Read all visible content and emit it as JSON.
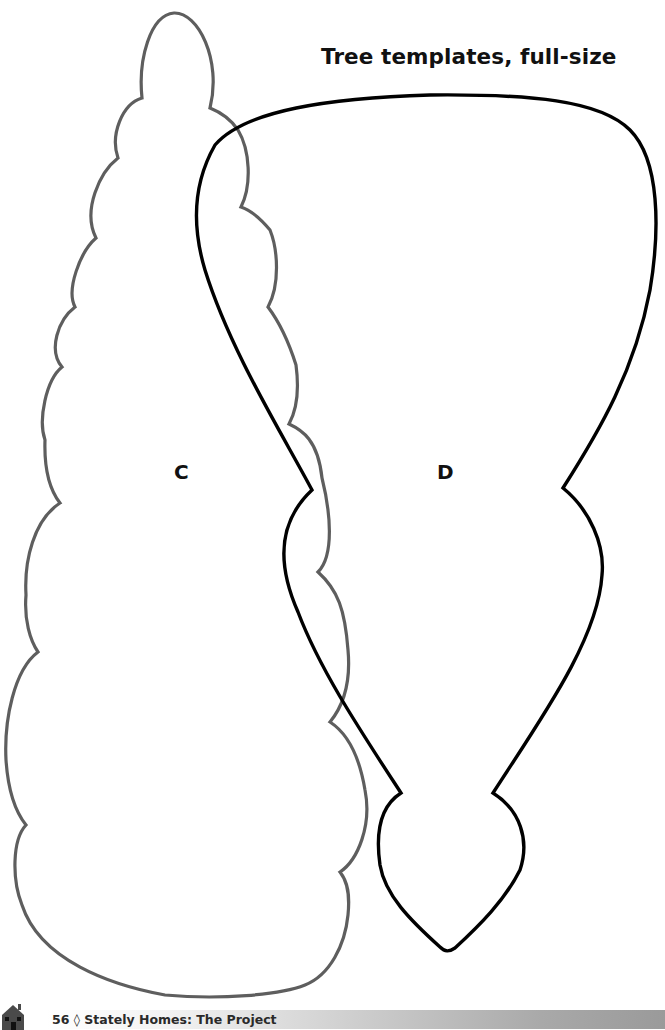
{
  "page": {
    "title": "Tree templates, full-size"
  },
  "templates": [
    {
      "id": "C",
      "label": "C",
      "stroke": "#5a5a5a",
      "shape": "scalloped-tall-tree-outline"
    },
    {
      "id": "D",
      "label": "D",
      "stroke": "#000000",
      "shape": "rounded-cone-tree-with-pointed-base"
    }
  ],
  "footer": {
    "page_number": "56",
    "separator": "◊",
    "book_title": "Stately Homes: The Project",
    "text": "56 ◊ Stately Homes: The Project",
    "icon": "house-icon"
  }
}
